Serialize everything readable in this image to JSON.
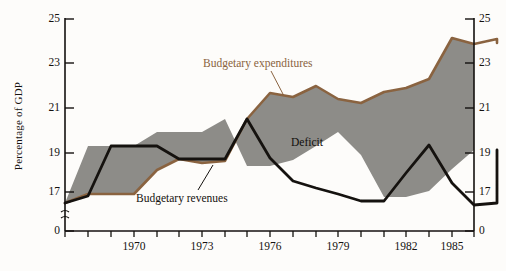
{
  "chart": {
    "type": "area",
    "ylabel": "Percentage of GDP",
    "xlabel": "",
    "y_axis": {
      "ticks": [
        25,
        23,
        21,
        19,
        17,
        0
      ],
      "tick_labels": [
        "25",
        "23",
        "21",
        "19",
        "17",
        "0"
      ],
      "break_symbol": "≈",
      "min_plot": 16,
      "max_plot": 25,
      "right_axis_mirrors_left": true
    },
    "x_axis": {
      "tick_years": [
        1967,
        1968,
        1969,
        1970,
        1971,
        1972,
        1973,
        1974,
        1975,
        1976,
        1977,
        1978,
        1979,
        1980,
        1981,
        1982,
        1983,
        1984,
        1985,
        1986
      ],
      "labeled_ticks": [
        "1970",
        "1973",
        "1976",
        "1979",
        "1982",
        "1985"
      ],
      "labeled_years": [
        1970,
        1973,
        1976,
        1979,
        1982,
        1985
      ]
    },
    "legend_position": "inline-annotations",
    "grid": false,
    "colors": {
      "expenditures_line": "#8a6340",
      "revenues_line": "#15120f",
      "deficit_fill": "#8d8c88",
      "axis": "#14110f",
      "background": "#fdfcfa"
    },
    "annotations": [
      {
        "name": "expenditures",
        "text": "Budgetary expenditures",
        "color": "#8a6340"
      },
      {
        "name": "revenues",
        "text": "Budgetary revenues",
        "color": "#15120f"
      },
      {
        "name": "deficit",
        "text": "Deficit",
        "color": "#100e0c"
      }
    ],
    "years": [
      1966,
      1967,
      1968,
      1969,
      1970,
      1971,
      1972,
      1973,
      1974,
      1975,
      1976,
      1977,
      1978,
      1979,
      1980,
      1981,
      1982,
      1983,
      1984,
      1985,
      1986
    ],
    "series": [
      {
        "name": "Budgetary expenditures",
        "values": [
          16.5,
          16.9,
          16.9,
          16.9,
          18.1,
          18.6,
          18.4,
          18.5,
          20.4,
          21.6,
          21.4,
          21.9,
          21.3,
          21.1,
          21.6,
          21.8,
          22.2,
          24.1,
          23.8,
          24.1,
          23.9
        ]
      },
      {
        "name": "Budgetary revenues",
        "values": [
          16.5,
          16.8,
          18.9,
          18.9,
          18.9,
          18.3,
          18.3,
          18.3,
          20.4,
          18.6,
          17.5,
          17.2,
          16.9,
          16.6,
          16.6,
          17.9,
          19.2,
          17.4,
          16.2,
          16.3,
          18.0
        ]
      }
    ],
    "deficit_description": "Shaded area between budgetary expenditures and budgetary revenues"
  }
}
